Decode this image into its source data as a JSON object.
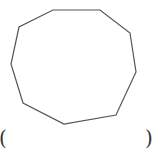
{
  "diagram": {
    "shape": "nonagon",
    "stroke_color": "#555555",
    "fill_color": "#ffffff",
    "stroke_width": "1.2",
    "points": "53,10 100,10 130,33 136,72 116,115 64,124 23,103 11,64 19,27"
  },
  "annotations": {
    "left_paren": "(",
    "right_paren": ")"
  }
}
